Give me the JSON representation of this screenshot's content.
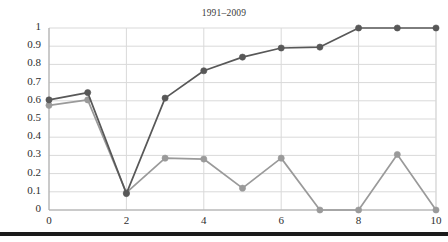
{
  "figure": {
    "title": "1991–2009",
    "background_color": "#ffffff",
    "grid_color": "#d9d9d9",
    "axis_color": "#bfbfbf",
    "bottom_rule_color": "#1b1b1b"
  },
  "chart_data": {
    "type": "line",
    "title": "1991–2009",
    "xlabel": "",
    "ylabel": "",
    "xlim": [
      0,
      10
    ],
    "ylim": [
      0,
      1
    ],
    "grid": true,
    "legend": "none",
    "x": [
      0,
      1,
      2,
      3,
      4,
      5,
      6,
      7,
      8,
      9,
      10
    ],
    "xticks": [
      "0",
      "2",
      "4",
      "6",
      "8",
      "10"
    ],
    "yticks": [
      "0",
      "0.1",
      "0.2",
      "0.3",
      "0.4",
      "0.5",
      "0.6",
      "0.7",
      "0.8",
      "0.9",
      "1"
    ],
    "series": [
      {
        "name": "cumulative",
        "color": "#585858",
        "marker": "circle",
        "values": [
          0.605,
          0.645,
          0.09,
          0.615,
          0.765,
          0.84,
          0.89,
          0.895,
          1.0,
          1.0,
          1.0
        ]
      },
      {
        "name": "per-step",
        "color": "#9a9a9a",
        "marker": "circle",
        "values": [
          0.575,
          0.605,
          0.095,
          0.285,
          0.28,
          0.12,
          0.285,
          0.0,
          0.0,
          0.305,
          0.0
        ]
      }
    ]
  }
}
